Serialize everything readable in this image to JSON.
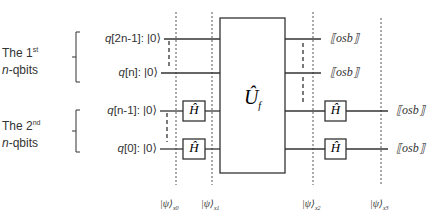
{
  "groups": [
    {
      "line1_prefix": "The 1",
      "line1_sup": "st",
      "line2_italic": "n",
      "line2_rest": "-qbits"
    },
    {
      "line1_prefix": "The 2",
      "line1_sup": "nd",
      "line2_italic": "n",
      "line2_rest": "-qbits"
    }
  ],
  "qubits": [
    {
      "name_italic": "q",
      "index": "[2n-1]",
      "state": ": |0⟩"
    },
    {
      "name_italic": "q",
      "index": "[n]",
      "state": ": |0⟩"
    },
    {
      "name_italic": "q",
      "index": "[n-1]",
      "state": ": |0⟩"
    },
    {
      "name_italic": "q",
      "index": "[0]",
      "state": ": |0⟩"
    }
  ],
  "gates": {
    "hadamard": "Ĥ",
    "oracle": "Û",
    "oracle_sub": "f"
  },
  "measurements": [
    "⟦osb⟧",
    "⟦osb⟧",
    "⟦osb⟧",
    "⟦osb⟧"
  ],
  "states": [
    {
      "ket": "|ψ⟩",
      "sub": "x0"
    },
    {
      "ket": "|ψ⟩",
      "sub": "x1"
    },
    {
      "ket": "|ψ⟩",
      "sub": "x2"
    },
    {
      "ket": "|ψ⟩",
      "sub": "x3"
    }
  ],
  "colors": {
    "line": "#333333",
    "text": "#333333",
    "background": "#ffffff"
  }
}
